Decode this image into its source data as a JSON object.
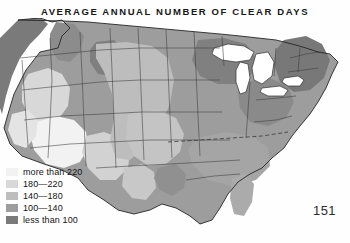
{
  "title": "AVERAGE ANNUAL NUMBER OF CLEAR DAYS",
  "page_number": "151",
  "legend": {
    "items": [
      {
        "label": "more than 220",
        "color": "#f2f2f2",
        "min": 220,
        "max": null
      },
      {
        "label": "180—220",
        "color": "#d8d8d8",
        "min": 180,
        "max": 220
      },
      {
        "label": "140—180",
        "color": "#bdbdbd",
        "min": 140,
        "max": 180
      },
      {
        "label": "100—140",
        "color": "#9d9d9d",
        "min": 100,
        "max": 140
      },
      {
        "label": "less than 100",
        "color": "#7a7a7a",
        "min": null,
        "max": 100
      }
    ]
  },
  "map": {
    "region": "Contiguous United States",
    "measure": "Average annual number of clear days",
    "projection_note": "grayscale choropleth, lighter = more clear days",
    "water_color": "#ffffff",
    "border_color": "#3a3a3a",
    "coast_color": "#262626",
    "water_bodies": [
      "Lake Superior",
      "Lake Michigan",
      "Lake Huron",
      "Lake Erie",
      "Lake Ontario"
    ],
    "shading_notes": [
      "Southwest (Arizona, New Mexico, southern Nevada) lightest – more than 220 clear days",
      "Great Basin and southern California 180–220 clear days",
      "Great Plains and Texas 140–180 clear days",
      "Midwest, Southeast and Gulf Coast 100–140 clear days",
      "Pacific Northwest, Great Lakes and Northeast darkest – less than 100 clear days"
    ]
  }
}
